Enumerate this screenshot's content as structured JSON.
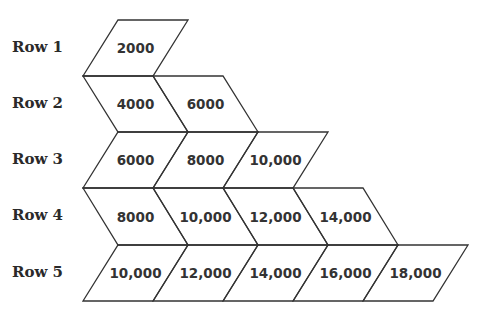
{
  "rows": [
    {
      "label": "Row 1",
      "values": [
        "2000"
      ]
    },
    {
      "label": "Row 2",
      "values": [
        "4000",
        "6000"
      ]
    },
    {
      "label": "Row 3",
      "values": [
        "6000",
        "8000",
        "10,000"
      ]
    },
    {
      "label": "Row 4",
      "values": [
        "8000",
        "10,000",
        "12,000",
        "14,000"
      ]
    },
    {
      "label": "Row 5",
      "values": [
        "10,000",
        "12,000",
        "14,000",
        "16,000",
        "18,000"
      ]
    }
  ],
  "colors": {
    "line": "#333333",
    "text": "#333333",
    "background": "#ffffff"
  }
}
